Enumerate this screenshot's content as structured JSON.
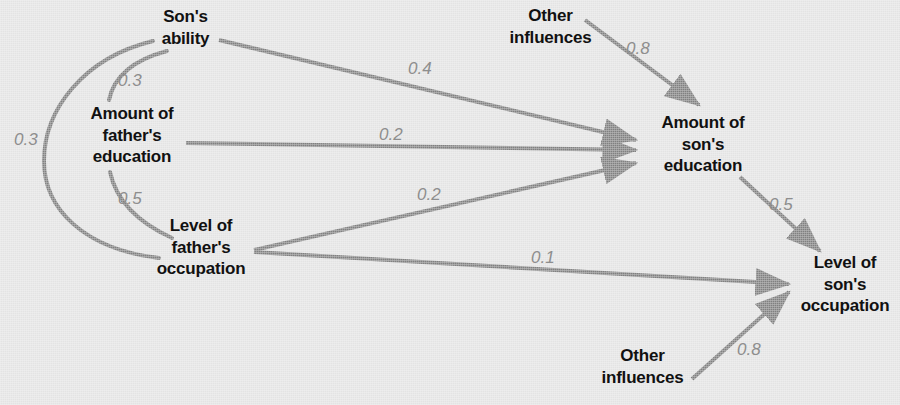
{
  "figure": {
    "type": "path-diagram",
    "background_color": "#e3e3e3",
    "edge_color": "#808080",
    "label_color": "#8e8e8e",
    "node_text_color": "#111111"
  },
  "nodes": [
    {
      "id": "sons_ability",
      "label": "Son's\nability"
    },
    {
      "id": "fathers_education",
      "label": "Amount of\nfather's\neducation"
    },
    {
      "id": "fathers_occupation",
      "label": "Level of\nfather's\noccupation"
    },
    {
      "id": "other_influences_education",
      "label": "Other\ninfluences"
    },
    {
      "id": "sons_education",
      "label": "Amount of\nson's\neducation"
    },
    {
      "id": "sons_occupation",
      "label": "Level of\nson's\noccupation"
    },
    {
      "id": "other_influences_occupation",
      "label": "Other\ninfluences"
    }
  ],
  "edges": [
    {
      "id": "ability_to_fathers_education",
      "from": "sons_ability",
      "to": "fathers_education",
      "coefficient": "0.3",
      "kind": "correlation"
    },
    {
      "id": "fathers_education_to_occupation",
      "from": "fathers_education",
      "to": "fathers_occupation",
      "coefficient": "0.5",
      "kind": "correlation"
    },
    {
      "id": "ability_to_fathers_occupation",
      "from": "sons_ability",
      "to": "fathers_occupation",
      "coefficient": "0.3",
      "kind": "correlation"
    },
    {
      "id": "ability_to_sons_education",
      "from": "sons_ability",
      "to": "sons_education",
      "coefficient": "0.4",
      "kind": "causal"
    },
    {
      "id": "fathers_education_to_sons_education",
      "from": "fathers_education",
      "to": "sons_education",
      "coefficient": "0.2",
      "kind": "causal"
    },
    {
      "id": "fathers_occupation_to_sons_education",
      "from": "fathers_occupation",
      "to": "sons_education",
      "coefficient": "0.2",
      "kind": "causal"
    },
    {
      "id": "other_to_sons_education",
      "from": "other_influences_education",
      "to": "sons_education",
      "coefficient": "0.8",
      "kind": "causal"
    },
    {
      "id": "fathers_occupation_to_sons_occupation",
      "from": "fathers_occupation",
      "to": "sons_occupation",
      "coefficient": "0.1",
      "kind": "causal"
    },
    {
      "id": "sons_education_to_sons_occupation",
      "from": "sons_education",
      "to": "sons_occupation",
      "coefficient": "0.5",
      "kind": "causal"
    },
    {
      "id": "other_to_sons_occupation",
      "from": "other_influences_occupation",
      "to": "sons_occupation",
      "coefficient": "0.8",
      "kind": "causal"
    }
  ],
  "coefficient_labels": {
    "ability_fathers_education": "0.3",
    "fathers_education_occupation": "0.5",
    "ability_fathers_occupation": "0.3",
    "ability_sons_education": "0.4",
    "fathers_education_sons_education": "0.2",
    "fathers_occupation_sons_education": "0.2",
    "other_sons_education": "0.8",
    "fathers_occupation_sons_occupation": "0.1",
    "sons_education_sons_occupation": "0.5",
    "other_sons_occupation": "0.8"
  }
}
